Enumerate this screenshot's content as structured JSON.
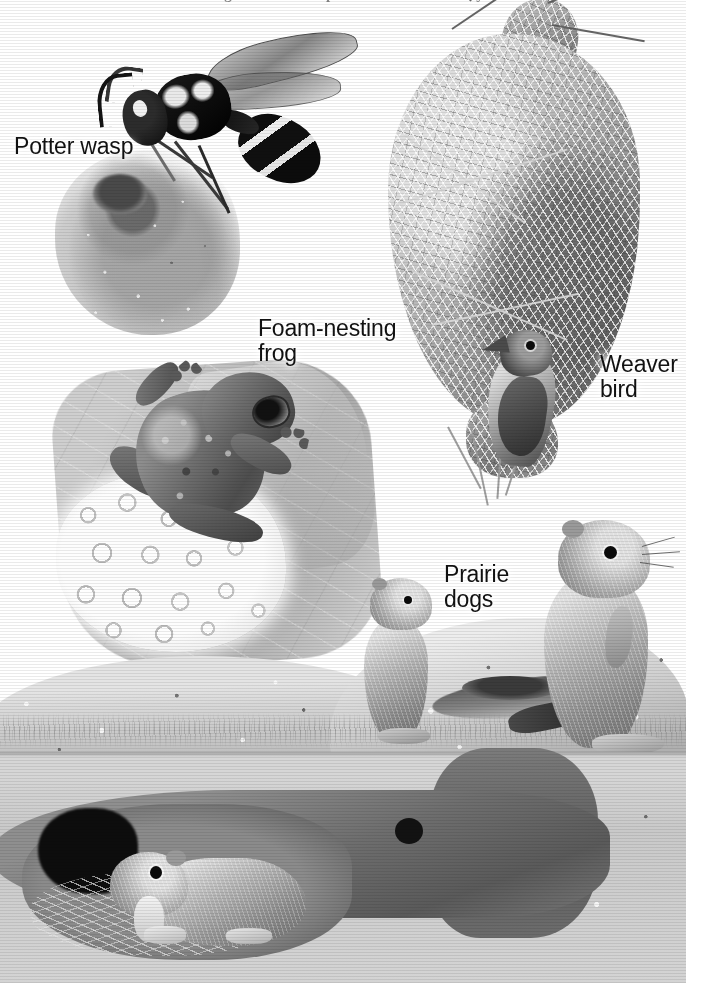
{
  "figure": {
    "medium": "grayscale airbrush / gouache scientific illustration",
    "caption_top_cropped": "are among the most complex structures built by animals",
    "background_color": "#ffffff",
    "ink_color": "#111111"
  },
  "labels": [
    {
      "id": "potter-wasp",
      "text": "Potter wasp"
    },
    {
      "id": "foam-frog",
      "text": "Foam-nesting\nfrog"
    },
    {
      "id": "weaver-bird",
      "text": "Weaver\nbird"
    },
    {
      "id": "prairie-dogs",
      "text": "Prairie\ndogs"
    }
  ],
  "subjects": {
    "potter_wasp": {
      "label": "Potter wasp",
      "nest_type": "mud pot",
      "parts": {
        "head": "wasp-head",
        "thorax": "wasp-thorax",
        "abdomen": "wasp-abdomen"
      }
    },
    "foam_frog": {
      "label": "Foam-nesting frog",
      "nest_type": "foam egg mass on leaf"
    },
    "weaver_bird": {
      "label": "Weaver bird",
      "nest_type": "woven hanging grass nest"
    },
    "prairie_dogs": {
      "label": "Prairie dogs",
      "nest_type": "burrow with mound and underground chamber",
      "count_above_ground": 2,
      "count_below_ground": 1
    }
  },
  "scene": {
    "above_ground_label": "ground surface with grass and burrow mound",
    "below_ground_label": "underground cutaway with tunnel and nest chamber"
  }
}
